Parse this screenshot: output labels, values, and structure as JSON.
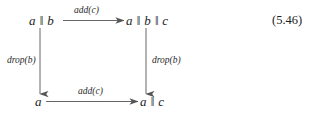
{
  "figure": {
    "type": "commutative-diagram",
    "equation_number": "(5.46)",
    "parallel_symbol": "‖",
    "nodes": {
      "top_left": {
        "id": "a-par-b",
        "text": "a ‖ b"
      },
      "top_right": {
        "id": "a-par-b-par-c",
        "text": "a ‖ b ‖ c"
      },
      "bottom_left": {
        "id": "a",
        "text": "a"
      },
      "bottom_right": {
        "id": "a-par-c",
        "text": "a ‖ c"
      }
    },
    "arrows": {
      "top": {
        "label": "add(c)",
        "from": "top_left",
        "to": "top_right",
        "direction": "right"
      },
      "bottom": {
        "label": "add(c)",
        "from": "bottom_left",
        "to": "bottom_right",
        "direction": "right"
      },
      "left": {
        "label": "drop(b)",
        "from": "top_left",
        "to": "bottom_left",
        "direction": "down"
      },
      "right": {
        "label": "drop(b)",
        "from": "top_right",
        "to": "bottom_right",
        "direction": "down"
      }
    },
    "colors": {
      "background": "#ffffff",
      "ink": "#1d1d1d",
      "stroke": "#555555"
    }
  }
}
